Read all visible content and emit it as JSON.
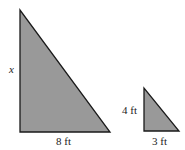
{
  "diagram": {
    "fill_color": "#999999",
    "stroke_color": "#1a1a1a",
    "large_triangle": {
      "vertical_side_label": "x",
      "base_label": "8 ft"
    },
    "small_triangle": {
      "vertical_side_label": "4 ft",
      "base_label": "3 ft"
    }
  }
}
